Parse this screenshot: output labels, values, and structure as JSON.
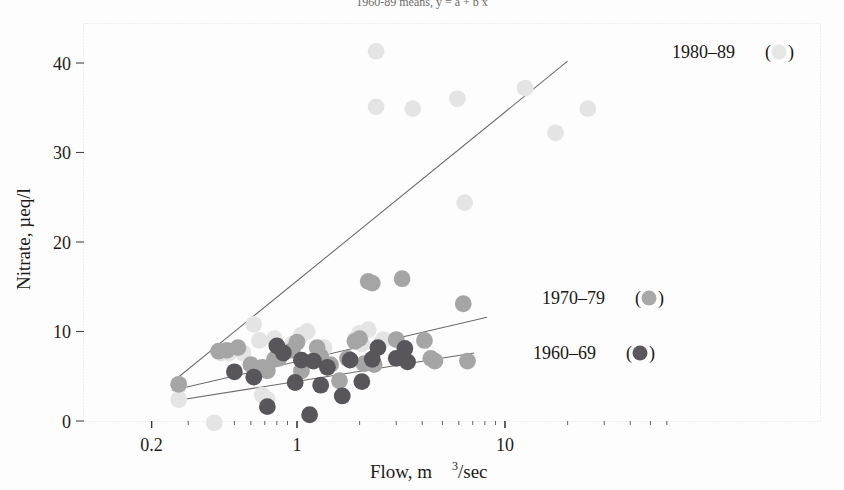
{
  "title_partial": "1960-89 means, y = a + b x",
  "axes": {
    "x_label": "Flow, m",
    "x_label_sup": "3",
    "x_label_tail": "/sec",
    "y_label": "Nitrate, µeq/l",
    "x_ticks": [
      "0.2",
      "1",
      "10"
    ],
    "y_ticks": [
      "0",
      "10",
      "20",
      "30",
      "40"
    ]
  },
  "legend": [
    {
      "label": "1980–89",
      "open": "(",
      "close": ")",
      "color": "#e4e4e4"
    },
    {
      "label": "1970–79",
      "open": "(",
      "close": ")",
      "color": "#a5a5a5"
    },
    {
      "label": "1960–69",
      "open": "(",
      "close": ")",
      "color": "#58565a"
    }
  ],
  "chart_data": {
    "type": "scatter",
    "title": "1960-89 means, y = a + b x",
    "xlabel": "Flow, m3/sec",
    "ylabel": "Nitrate, µeq/l",
    "xscale": "log",
    "xlim": [
      0.2,
      60
    ],
    "ylim": [
      -1.5,
      44
    ],
    "grid": false,
    "legend_position": "right-inside",
    "x_tick_values": [
      0.2,
      1,
      10
    ],
    "y_tick_values": [
      0,
      10,
      20,
      30,
      40
    ],
    "series": [
      {
        "name": "1980-89",
        "color": "#e4e4e4",
        "points": [
          [
            0.27,
            4.0
          ],
          [
            0.27,
            2.4
          ],
          [
            0.4,
            -0.2
          ],
          [
            0.43,
            7.6
          ],
          [
            0.47,
            7.6
          ],
          [
            0.55,
            7.6
          ],
          [
            0.62,
            10.8
          ],
          [
            0.66,
            9.0
          ],
          [
            0.68,
            2.9
          ],
          [
            0.72,
            2.4
          ],
          [
            0.78,
            9.2
          ],
          [
            0.95,
            8.6
          ],
          [
            1.05,
            9.6
          ],
          [
            1.12,
            10.0
          ],
          [
            1.2,
            6.7
          ],
          [
            1.35,
            8.2
          ],
          [
            1.9,
            9.1
          ],
          [
            2.0,
            9.8
          ],
          [
            2.05,
            8.6
          ],
          [
            2.2,
            10.2
          ],
          [
            2.4,
            41.3
          ],
          [
            2.4,
            35.1
          ],
          [
            2.6,
            9.1
          ],
          [
            3.6,
            34.9
          ],
          [
            5.9,
            36.0
          ],
          [
            6.4,
            24.4
          ],
          [
            12.5,
            37.2
          ],
          [
            17.5,
            32.2
          ],
          [
            25.0,
            34.9
          ]
        ]
      },
      {
        "name": "1970-79",
        "color": "#a5a5a5",
        "points": [
          [
            0.27,
            4.1
          ],
          [
            0.42,
            7.8
          ],
          [
            0.46,
            7.9
          ],
          [
            0.52,
            8.2
          ],
          [
            0.6,
            6.3
          ],
          [
            0.68,
            6.0
          ],
          [
            0.72,
            5.6
          ],
          [
            0.78,
            6.9
          ],
          [
            0.82,
            7.0
          ],
          [
            0.95,
            7.9
          ],
          [
            1.0,
            8.8
          ],
          [
            1.05,
            5.6
          ],
          [
            1.25,
            8.2
          ],
          [
            1.3,
            7.2
          ],
          [
            1.45,
            6.3
          ],
          [
            1.6,
            4.5
          ],
          [
            1.75,
            7.0
          ],
          [
            1.9,
            8.9
          ],
          [
            2.0,
            9.2
          ],
          [
            2.1,
            6.4
          ],
          [
            2.2,
            15.6
          ],
          [
            2.3,
            15.4
          ],
          [
            2.35,
            6.3
          ],
          [
            3.0,
            9.1
          ],
          [
            3.2,
            15.9
          ],
          [
            4.1,
            9.0
          ],
          [
            4.4,
            7.0
          ],
          [
            4.6,
            6.7
          ],
          [
            6.3,
            13.1
          ],
          [
            6.6,
            6.7
          ]
        ]
      },
      {
        "name": "1960-69",
        "color": "#58565a",
        "points": [
          [
            0.5,
            5.5
          ],
          [
            0.62,
            4.9
          ],
          [
            0.72,
            1.6
          ],
          [
            0.8,
            8.4
          ],
          [
            0.86,
            7.6
          ],
          [
            0.98,
            4.3
          ],
          [
            1.05,
            6.8
          ],
          [
            1.15,
            0.7
          ],
          [
            1.2,
            6.7
          ],
          [
            1.3,
            4.0
          ],
          [
            1.4,
            6.0
          ],
          [
            1.65,
            2.8
          ],
          [
            1.8,
            6.8
          ],
          [
            2.05,
            4.4
          ],
          [
            2.3,
            6.9
          ],
          [
            2.45,
            8.2
          ],
          [
            3.0,
            7.0
          ],
          [
            3.3,
            8.1
          ],
          [
            3.4,
            6.6
          ]
        ]
      }
    ],
    "trend_lines": [
      {
        "name": "1980-89 fit",
        "x0": 0.25,
        "y0": 4.3,
        "x1": 20.0,
        "y1": 40.2
      },
      {
        "name": "1970-79 fit",
        "x0": 0.25,
        "y0": 3.4,
        "x1": 8.2,
        "y1": 11.6
      },
      {
        "name": "1960-69 fit",
        "x0": 0.25,
        "y0": 2.2,
        "x1": 7.1,
        "y1": 7.6
      }
    ]
  }
}
